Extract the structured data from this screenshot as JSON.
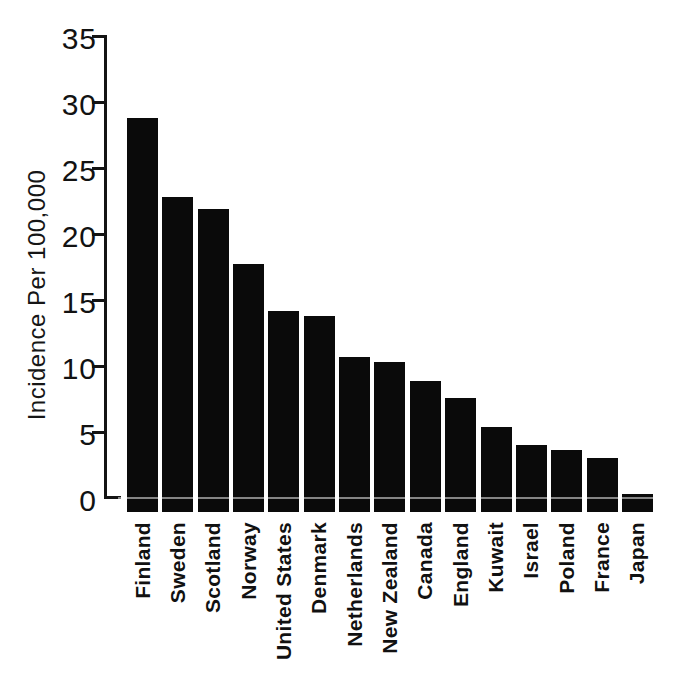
{
  "chart_data": {
    "type": "bar",
    "title": "",
    "xlabel": "",
    "ylabel": "Incidence Per 100,000",
    "categories": [
      "Finland",
      "Sweden",
      "Scotland",
      "Norway",
      "United States",
      "Denmark",
      "Netherlands",
      "New Zealand",
      "Canada",
      "England",
      "Kuwait",
      "Israel",
      "Poland",
      "France",
      "Japan"
    ],
    "values": [
      28.8,
      22.8,
      21.9,
      17.7,
      14.2,
      13.8,
      10.7,
      10.3,
      8.9,
      7.6,
      5.4,
      4.0,
      3.6,
      3.0,
      0.3
    ],
    "ylim": [
      0,
      35
    ],
    "yticks": [
      0,
      5,
      10,
      15,
      20,
      25,
      30,
      35
    ],
    "grid": false,
    "legend": null,
    "bar_color": "#0a0a0a",
    "background_color": "#ffffff",
    "orientation": "vertical",
    "x_tick_label_rotation_deg": 90
  }
}
